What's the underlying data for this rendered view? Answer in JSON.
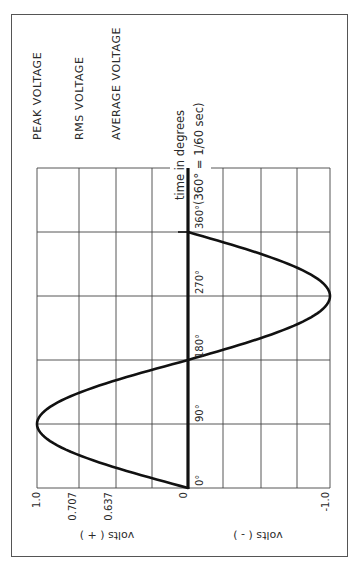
{
  "chart_data": {
    "type": "line",
    "orientation": "rotated-90-ccw",
    "title": "",
    "xlabel": "time in degrees",
    "xlabel_note": "(360° = 1/60 sec)",
    "ylabel_positive": "volts ( + )",
    "ylabel_negative": "volts ( - )",
    "x_ticks": [
      "0°",
      "90°",
      "180°",
      "270°",
      "360°"
    ],
    "x_tick_values": [
      0,
      90,
      180,
      270,
      360
    ],
    "y_ticks": [
      "1.0",
      "0.707",
      "0.637",
      "0",
      "-1.0"
    ],
    "y_tick_values": [
      1.0,
      0.707,
      0.637,
      0,
      -1.0
    ],
    "xlim": [
      0,
      360
    ],
    "ylim": [
      -1.0,
      1.0
    ],
    "grid": true,
    "reference_lines": [
      {
        "label": "PEAK VOLTAGE",
        "value": 1.0
      },
      {
        "label": "RMS VOLTAGE",
        "value": 0.707
      },
      {
        "label": "AVERAGE VOLTAGE",
        "value": 0.637
      }
    ],
    "series": [
      {
        "name": "sine wave voltage",
        "x": [
          0,
          30,
          60,
          90,
          120,
          150,
          180,
          210,
          240,
          270,
          300,
          330,
          360
        ],
        "values": [
          0,
          0.5,
          0.866,
          1.0,
          0.866,
          0.5,
          0,
          -0.5,
          -0.866,
          -1.0,
          -0.866,
          -0.5,
          0
        ]
      }
    ]
  },
  "labels": {
    "peak": "PEAK VOLTAGE",
    "rms": "RMS VOLTAGE",
    "average": "AVERAGE VOLTAGE",
    "time_axis": "time in degrees",
    "time_note": "(360° = 1/60 sec)",
    "deg_0": "0°",
    "deg_90": "90°",
    "deg_180": "180°",
    "deg_270": "270°",
    "deg_360": "360°",
    "v_peak": "1.0",
    "v_rms": "0.707",
    "v_avg": "0.637",
    "v_zero": "0",
    "v_neg": "-1.0",
    "volts_pos": "volts ( + )",
    "volts_neg": "volts ( - )"
  },
  "style": {
    "ink": "#1a1a1a",
    "grid": "#444444",
    "frame": "#555555"
  }
}
